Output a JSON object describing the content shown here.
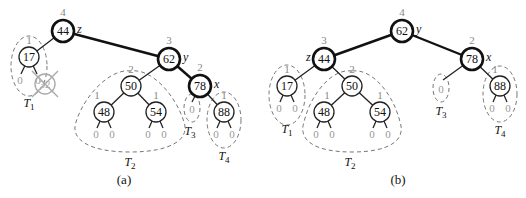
{
  "panels": [
    {
      "caption": "(a)",
      "nodes": [
        {
          "key": "44",
          "height": "4",
          "tag": "z"
        },
        {
          "key": "17",
          "height": "1"
        },
        {
          "key": "62",
          "height": "3",
          "tag": "y"
        },
        {
          "key": "50",
          "height": "2"
        },
        {
          "key": "48",
          "height": "1"
        },
        {
          "key": "54",
          "height": "1"
        },
        {
          "key": "78",
          "height": "2",
          "tag": "x"
        },
        {
          "key": "88",
          "height": "1"
        }
      ],
      "deleted_node": "32",
      "leaf_label": "0",
      "subtrees": [
        "T1",
        "T2",
        "T3",
        "T4"
      ]
    },
    {
      "caption": "(b)",
      "nodes": [
        {
          "key": "62",
          "height": "4",
          "tag": "y"
        },
        {
          "key": "44",
          "height": "3",
          "tag": "z"
        },
        {
          "key": "17",
          "height": "1"
        },
        {
          "key": "50",
          "height": "2"
        },
        {
          "key": "48",
          "height": "1"
        },
        {
          "key": "54",
          "height": "1"
        },
        {
          "key": "78",
          "height": "2",
          "tag": "x"
        },
        {
          "key": "88",
          "height": "1"
        }
      ],
      "leaf_label": "0",
      "subtrees": [
        "T1",
        "T2",
        "T3",
        "T4"
      ]
    }
  ]
}
